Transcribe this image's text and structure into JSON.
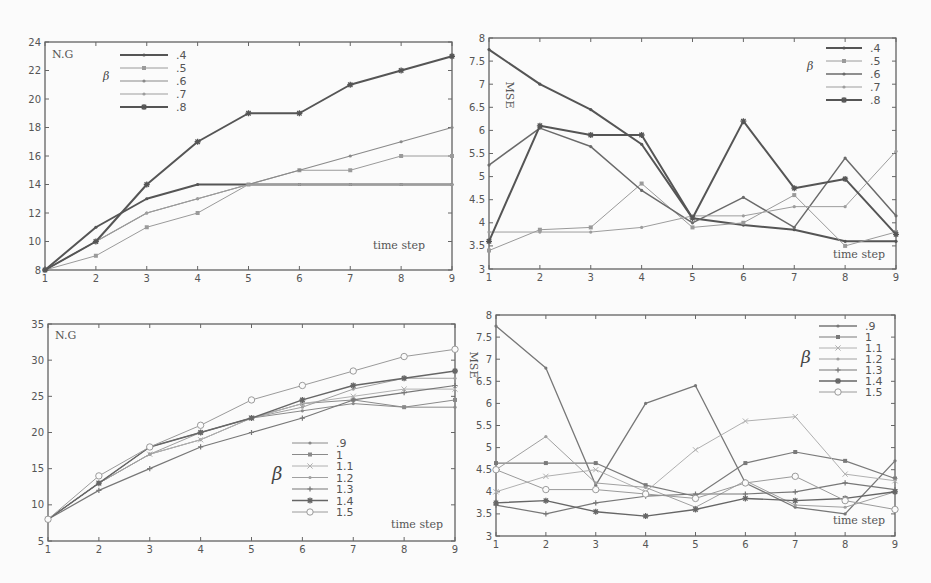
{
  "chart_data": [
    {
      "id": "tl",
      "type": "line",
      "title": "",
      "ylabel": "N.G",
      "xlabel": "time step",
      "legend_title": "β",
      "legend_position": "top-left",
      "x": [
        1,
        2,
        3,
        4,
        5,
        6,
        7,
        8,
        9
      ],
      "xlim": [
        1,
        9
      ],
      "ylim": [
        8,
        24
      ],
      "yticks": [
        8,
        10,
        12,
        14,
        16,
        18,
        20,
        22,
        24
      ],
      "xticks": [
        1,
        2,
        3,
        4,
        5,
        6,
        7,
        8,
        9
      ],
      "series": [
        {
          "name": ".4",
          "values": [
            8,
            11,
            13,
            14,
            14,
            14,
            14,
            14,
            14
          ],
          "color": "#555555",
          "width": 2,
          "marker": "dot"
        },
        {
          "name": ".5",
          "values": [
            8,
            9,
            11,
            12,
            14,
            15,
            15,
            16,
            16
          ],
          "color": "#9a9a9a",
          "width": 1,
          "marker": "square"
        },
        {
          "name": ".6",
          "values": [
            8,
            10,
            12,
            13,
            14,
            15,
            16,
            17,
            18
          ],
          "color": "#8a8a8a",
          "width": 1.2,
          "marker": "dot"
        },
        {
          "name": ".7",
          "values": [
            8,
            10,
            12,
            13,
            14,
            14,
            14,
            14,
            14
          ],
          "color": "#9d9d9d",
          "width": 1,
          "marker": "dot"
        },
        {
          "name": ".8",
          "values": [
            8,
            10,
            14,
            17,
            19,
            19,
            21,
            22,
            23
          ],
          "color": "#555555",
          "width": 2,
          "marker": "star"
        }
      ]
    },
    {
      "id": "tr",
      "type": "line",
      "title": "",
      "ylabel": "MSE",
      "xlabel": "time step",
      "legend_title": "β",
      "legend_position": "top-right",
      "x": [
        1,
        2,
        3,
        4,
        5,
        6,
        7,
        8,
        9
      ],
      "xlim": [
        1,
        9
      ],
      "ylim": [
        3,
        8
      ],
      "yticks": [
        3,
        3.5,
        4,
        4.5,
        5,
        5.5,
        6,
        6.5,
        7,
        7.5,
        8
      ],
      "xticks": [
        1,
        2,
        3,
        4,
        5,
        6,
        7,
        8,
        9
      ],
      "series": [
        {
          "name": ".4",
          "values": [
            7.75,
            7.0,
            6.45,
            5.7,
            4.1,
            3.95,
            3.85,
            3.6,
            3.6
          ],
          "color": "#555555",
          "width": 2,
          "marker": "dot"
        },
        {
          "name": ".5",
          "values": [
            3.4,
            3.85,
            3.9,
            4.85,
            3.9,
            4.0,
            4.6,
            3.5,
            3.8
          ],
          "color": "#9a9a9a",
          "width": 1,
          "marker": "square"
        },
        {
          "name": ".6",
          "values": [
            5.25,
            6.05,
            5.65,
            4.7,
            4.0,
            4.55,
            3.9,
            5.4,
            4.15
          ],
          "color": "#6a6a6a",
          "width": 1.5,
          "marker": "dot"
        },
        {
          "name": ".7",
          "values": [
            3.8,
            3.8,
            3.8,
            3.9,
            4.15,
            4.15,
            4.35,
            4.35,
            5.55
          ],
          "color": "#9d9d9d",
          "width": 1,
          "marker": "dot"
        },
        {
          "name": ".8",
          "values": [
            3.6,
            6.1,
            5.9,
            5.9,
            4.1,
            6.2,
            4.75,
            4.95,
            3.75
          ],
          "color": "#555555",
          "width": 2,
          "marker": "star"
        }
      ]
    },
    {
      "id": "bl",
      "type": "line",
      "title": "",
      "ylabel": "N.G",
      "xlabel": "time step",
      "legend_title": "β",
      "legend_position": "bottom-right",
      "x": [
        1,
        2,
        3,
        4,
        5,
        6,
        7,
        8,
        9
      ],
      "xlim": [
        1,
        9
      ],
      "ylim": [
        5,
        35
      ],
      "yticks": [
        5,
        10,
        15,
        20,
        25,
        30,
        35
      ],
      "xticks": [
        1,
        2,
        3,
        4,
        5,
        6,
        7,
        8,
        9
      ],
      "series": [
        {
          "name": ".9",
          "values": [
            8,
            13,
            17,
            19,
            22,
            23,
            24,
            23.5,
            23.5
          ],
          "color": "#8a8a8a",
          "width": 1,
          "marker": "dot"
        },
        {
          "name": "1",
          "values": [
            8,
            13,
            18,
            20,
            22,
            24,
            24.5,
            23.5,
            24.5
          ],
          "color": "#8a8a8a",
          "width": 1,
          "marker": "square"
        },
        {
          "name": "1.1",
          "values": [
            8,
            13,
            17,
            19,
            22,
            24,
            25,
            26,
            26
          ],
          "color": "#b0b0b0",
          "width": 1,
          "marker": "x"
        },
        {
          "name": "1.2",
          "values": [
            8,
            13,
            17,
            20,
            22,
            23.5,
            26,
            27.5,
            27.5
          ],
          "color": "#a0a0a0",
          "width": 1,
          "marker": "dot"
        },
        {
          "name": "1.3",
          "values": [
            8,
            12,
            15,
            18,
            20,
            22,
            24.5,
            25.5,
            26.5
          ],
          "color": "#777777",
          "width": 1.2,
          "marker": "plus"
        },
        {
          "name": "1.4",
          "values": [
            8,
            13,
            18,
            20,
            22,
            24.5,
            26.5,
            27.5,
            28.5
          ],
          "color": "#666666",
          "width": 1.4,
          "marker": "star"
        },
        {
          "name": "1.5",
          "values": [
            8,
            14,
            18,
            21,
            24.5,
            26.5,
            28.5,
            30.5,
            31.5
          ],
          "color": "#9a9a9a",
          "width": 1,
          "marker": "circle"
        }
      ]
    },
    {
      "id": "br",
      "type": "line",
      "title": "",
      "ylabel": "MSE",
      "xlabel": "time step",
      "legend_title": "β",
      "legend_position": "top-right",
      "x": [
        1,
        2,
        3,
        4,
        5,
        6,
        7,
        8,
        9
      ],
      "xlim": [
        1,
        9
      ],
      "ylim": [
        3,
        8
      ],
      "yticks": [
        3,
        3.5,
        4,
        4.5,
        5,
        5.5,
        6,
        6.5,
        7,
        7.5,
        8
      ],
      "xticks": [
        1,
        2,
        3,
        4,
        5,
        6,
        7,
        8,
        9
      ],
      "series": [
        {
          "name": ".9",
          "values": [
            7.75,
            6.8,
            4.15,
            6.0,
            6.4,
            4.2,
            3.65,
            3.5,
            4.7
          ],
          "color": "#777777",
          "width": 1.3,
          "marker": "dot"
        },
        {
          "name": "1",
          "values": [
            4.65,
            4.65,
            4.65,
            4.15,
            3.9,
            4.65,
            4.9,
            4.7,
            4.3
          ],
          "color": "#7a7a7a",
          "width": 1.2,
          "marker": "square"
        },
        {
          "name": "1.1",
          "values": [
            4.0,
            4.35,
            4.5,
            4.0,
            4.95,
            5.6,
            5.7,
            4.4,
            4.25
          ],
          "color": "#b0b0b0",
          "width": 1,
          "marker": "x"
        },
        {
          "name": "1.2",
          "values": [
            4.5,
            5.25,
            4.2,
            4.1,
            3.65,
            4.25,
            3.7,
            3.65,
            4.0
          ],
          "color": "#a0a0a0",
          "width": 1,
          "marker": "dot"
        },
        {
          "name": "1.3",
          "values": [
            3.7,
            3.5,
            3.75,
            3.9,
            3.95,
            3.95,
            4.0,
            4.2,
            4.05
          ],
          "color": "#777777",
          "width": 1.2,
          "marker": "plus"
        },
        {
          "name": "1.4",
          "values": [
            3.75,
            3.8,
            3.55,
            3.45,
            3.6,
            3.85,
            3.8,
            3.85,
            4.0
          ],
          "color": "#666666",
          "width": 1.4,
          "marker": "star"
        },
        {
          "name": "1.5",
          "values": [
            4.5,
            4.05,
            4.05,
            3.95,
            3.85,
            4.2,
            4.35,
            3.8,
            3.6
          ],
          "color": "#9a9a9a",
          "width": 1,
          "marker": "circle"
        }
      ]
    }
  ]
}
